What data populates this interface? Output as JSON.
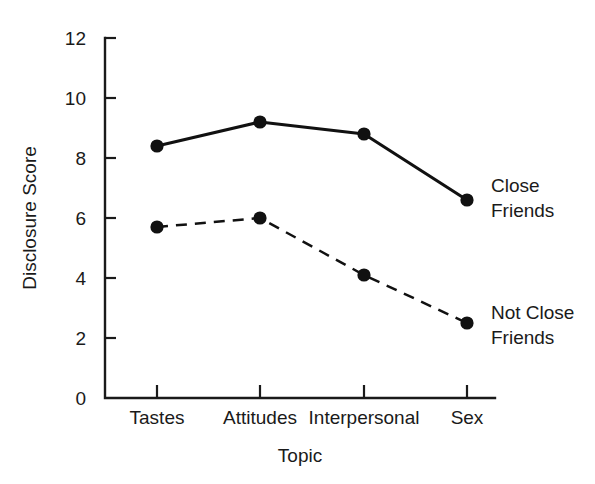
{
  "chart_data": {
    "type": "line",
    "title": "",
    "xlabel": "Topic",
    "ylabel": "Disclosure Score",
    "categories": [
      "Tastes",
      "Attitudes",
      "Interpersonal",
      "Sex"
    ],
    "ylim": [
      0,
      12
    ],
    "yticks": [
      0,
      2,
      4,
      6,
      8,
      10,
      12
    ],
    "ytick_labels": [
      "0",
      "2",
      "4",
      "6",
      "8",
      "10",
      "12"
    ],
    "grid": false,
    "legend_position": "inline-right",
    "series": [
      {
        "name": "Close Friends",
        "label_lines": [
          "Close",
          "Friends"
        ],
        "style": "solid",
        "color": "#111111",
        "marker": "filled-circle",
        "values": [
          8.4,
          9.2,
          8.8,
          6.6
        ]
      },
      {
        "name": "Not Close Friends",
        "label_lines": [
          "Not Close",
          "Friends"
        ],
        "style": "dashed",
        "color": "#111111",
        "marker": "filled-circle",
        "values": [
          5.7,
          6.0,
          4.1,
          2.5
        ]
      }
    ]
  },
  "colors": {
    "background": "#ffffff",
    "ink": "#111111",
    "axis": "#1a1a1a"
  }
}
